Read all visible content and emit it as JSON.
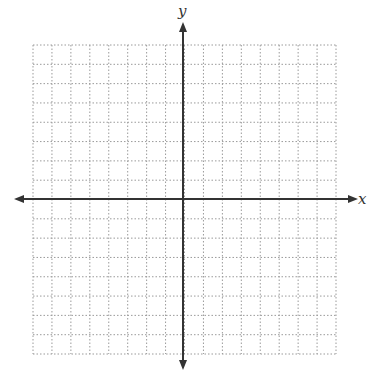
{
  "diagram": {
    "type": "coordinate-plane",
    "x_label": "x",
    "y_label": "y",
    "grid": {
      "columns": 16,
      "rows": 16,
      "style": "dotted",
      "color": "#9a9a9a"
    },
    "axis_color": "#333333",
    "ticks_labeled": false
  }
}
